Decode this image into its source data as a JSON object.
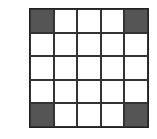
{
  "grid": {
    "rows": 5,
    "cols": 5,
    "fill_color": "#555555",
    "empty_color": "#ffffff",
    "filled_cells": [
      [
        0,
        0
      ],
      [
        0,
        4
      ],
      [
        4,
        0
      ],
      [
        4,
        4
      ]
    ]
  }
}
